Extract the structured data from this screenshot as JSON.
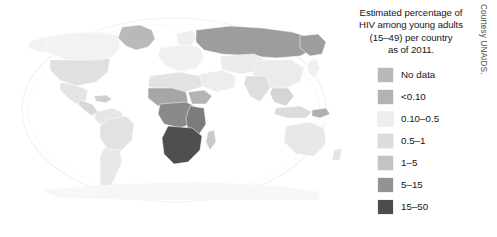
{
  "figure": {
    "kind": "world-choropleth-map",
    "background_color": "#ffffff"
  },
  "map": {
    "projection": "robinson",
    "graticule_color": "#f2f2f2",
    "country_border_color": "#ffffff",
    "regions": [
      {
        "name": "greenland",
        "class_label": "No data",
        "fill": "#b9b9b9"
      },
      {
        "name": "canada",
        "class_label": "<0.10",
        "fill": "#f2f2f2"
      },
      {
        "name": "alaska",
        "class_label": "<0.10",
        "fill": "#f2f2f2"
      },
      {
        "name": "united-states",
        "class_label": "0.10-0.5",
        "fill": "#e0e0e0"
      },
      {
        "name": "mexico",
        "class_label": "0.10-0.5",
        "fill": "#e4e4e4"
      },
      {
        "name": "central-america",
        "class_label": "0.5-1",
        "fill": "#d8d8d8"
      },
      {
        "name": "caribbean",
        "class_label": "0.5-1",
        "fill": "#cfcfcf"
      },
      {
        "name": "brazil",
        "class_label": "0.10-0.5",
        "fill": "#e2e2e2"
      },
      {
        "name": "south-america",
        "class_label": "0.10-0.5",
        "fill": "#e6e6e6"
      },
      {
        "name": "europe",
        "class_label": "<0.10",
        "fill": "#f0f0f0"
      },
      {
        "name": "russia",
        "class_label": "1-5",
        "fill": "#9d9d9d"
      },
      {
        "name": "north-africa",
        "class_label": "0.10-0.5",
        "fill": "#e3e3e3"
      },
      {
        "name": "west-africa",
        "class_label": "1-5",
        "fill": "#a6a6a6"
      },
      {
        "name": "central-africa",
        "class_label": "5-15",
        "fill": "#8a8a8a"
      },
      {
        "name": "east-africa",
        "class_label": "5-15",
        "fill": "#7c7c7c"
      },
      {
        "name": "southern-africa",
        "class_label": "15-50",
        "fill": "#4f4f4f"
      },
      {
        "name": "middle-east",
        "class_label": "<0.10",
        "fill": "#ededed"
      },
      {
        "name": "india",
        "class_label": "0.10-0.5",
        "fill": "#dedede"
      },
      {
        "name": "china",
        "class_label": "<0.10",
        "fill": "#ebebeb"
      },
      {
        "name": "southeast-asia",
        "class_label": "0.5-1",
        "fill": "#d5d5d5"
      },
      {
        "name": "japan",
        "class_label": "<0.10",
        "fill": "#f0f0f0"
      },
      {
        "name": "australia",
        "class_label": "0.10-0.5",
        "fill": "#e8e8e8"
      },
      {
        "name": "new-guinea",
        "class_label": "1-5",
        "fill": "#b0b0b0"
      },
      {
        "name": "antarctica",
        "class_label": "No data",
        "fill": "#f7f7f7"
      }
    ]
  },
  "legend": {
    "title_lines": [
      "Estimated percentage of",
      "HIV among young adults",
      "(15–49) per country",
      "as of 2011."
    ],
    "entries": [
      {
        "label": "No data",
        "color": "#b9b9b9"
      },
      {
        "label": "<0.10",
        "color": "#b3b3b3"
      },
      {
        "label": "0.10–0.5",
        "color": "#ededed"
      },
      {
        "label": "0.5–1",
        "color": "#dcdcdc"
      },
      {
        "label": "1–5",
        "color": "#c3c3c3"
      },
      {
        "label": "5–15",
        "color": "#939393"
      },
      {
        "label": "15–50",
        "color": "#4d4d4d"
      }
    ]
  },
  "credit": {
    "text": "Courtesy UNAIDS."
  }
}
